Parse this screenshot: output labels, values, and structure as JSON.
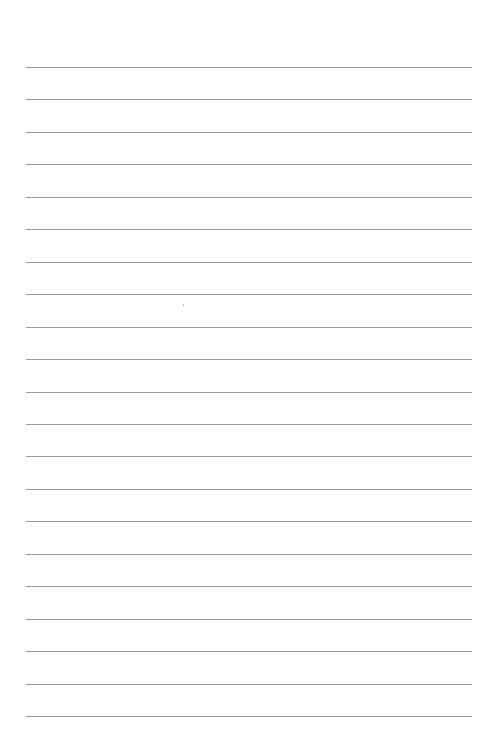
{
  "page": {
    "type": "lined-paper",
    "background_color": "#ffffff",
    "line_color": "#9a9a9a",
    "line_count": 21,
    "line_left": 26,
    "line_right": 472,
    "first_line_y": 67,
    "line_spacing": 32.45,
    "text": ""
  }
}
